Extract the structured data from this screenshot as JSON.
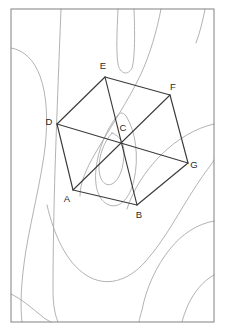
{
  "figure": {
    "frame": {
      "x": 11,
      "y": 9,
      "width": 203,
      "height": 313
    },
    "colors": {
      "background": "#ffffff",
      "frame_stroke": "#8c8c8c",
      "contour_stroke": "#a9a9a9",
      "polygon_stroke": "#3a3a3a",
      "label_text": "#2b2b2b"
    },
    "vertex_labels": [
      "A",
      "B",
      "C",
      "D",
      "E",
      "F",
      "G"
    ],
    "points": [
      {
        "name": "A",
        "label": "A",
        "x": 73,
        "y": 190,
        "label_x": 67,
        "label_y": 199
      },
      {
        "name": "B",
        "label": "B",
        "x": 137,
        "y": 205,
        "label_x": 139,
        "label_y": 215
      },
      {
        "name": "C",
        "label": "C",
        "x": 121,
        "y": 140,
        "label_x": 123,
        "label_y": 128
      },
      {
        "name": "D",
        "label": "D",
        "x": 57,
        "y": 124,
        "label_x": 49,
        "label_y": 122
      },
      {
        "name": "E",
        "label": "E",
        "x": 105,
        "y": 77,
        "label_x": 103,
        "label_y": 66
      },
      {
        "name": "F",
        "label": "F",
        "x": 170,
        "y": 95,
        "label_x": 173,
        "label_y": 87
      },
      {
        "name": "G",
        "label": "G",
        "x": 188,
        "y": 163,
        "label_x": 194,
        "label_y": 165
      }
    ],
    "edges": [
      {
        "name": "edge-A-D",
        "from": "A",
        "to": "D"
      },
      {
        "name": "edge-D-E",
        "from": "D",
        "to": "E"
      },
      {
        "name": "edge-E-F",
        "from": "E",
        "to": "F"
      },
      {
        "name": "edge-F-G",
        "from": "F",
        "to": "G"
      },
      {
        "name": "edge-G-B",
        "from": "G",
        "to": "B"
      },
      {
        "name": "edge-B-A",
        "from": "B",
        "to": "A"
      }
    ],
    "diagonals": [
      {
        "name": "diagonal-A-F",
        "from": "A",
        "to": "F"
      },
      {
        "name": "diagonal-B-E",
        "from": "B",
        "to": "E"
      },
      {
        "name": "diagonal-D-G",
        "from": "D",
        "to": "G"
      }
    ],
    "contours": [
      {
        "name": "contour-top-narrow-loop",
        "d": "M 118 9 C 117 32 116 52 118 64 C 120 74 128 76 132 68 C 135 58 135 32 134 9"
      },
      {
        "name": "contour-top-right-sweep",
        "d": "M 161 9 C 157 30 150 55 140 76 C 128 101 110 128 96 152 C 86 169 80 183 80 196"
      },
      {
        "name": "contour-left-vertical",
        "d": "M 61 9 C 60 34 59 60 58 86 C 57 112 56 140 55 170 C 54 205 53 250 53 290 C 53 305 55 315 58 322"
      },
      {
        "name": "contour-left-bulge",
        "d": "M 11 48 C 24 50 34 60 40 76 C 47 95 48 120 45 148 C 41 180 32 215 26 250 C 21 282 20 305 22 322"
      },
      {
        "name": "contour-center-small-loop",
        "d": "M 112 133 C 104 142 99 155 99 168 C 99 180 105 187 112 184 C 120 180 124 166 124 152 C 124 143 120 136 112 133 Z"
      },
      {
        "name": "contour-mid-oval",
        "d": "M 117 116 C 106 130 98 150 96 169 C 94 188 99 201 109 205 C 120 209 130 198 134 180 C 139 158 136 131 126 116 C 123 112 120 112 117 116 Z"
      },
      {
        "name": "contour-lower-left-basin",
        "d": "M 47 205 C 54 235 66 262 86 275 C 106 288 128 281 145 262 C 165 240 180 210 196 186 C 205 172 212 164 214 160"
      },
      {
        "name": "contour-right-upper-sweep",
        "d": "M 214 124 C 196 128 177 139 161 155 C 145 171 133 190 127 209"
      },
      {
        "name": "contour-right-lower-sweep",
        "d": "M 214 221 C 197 224 182 234 170 249 C 156 266 146 289 142 310 C 140 317 139 321 139 322"
      },
      {
        "name": "contour-bottom-left-diagonal",
        "d": "M 11 294 C 20 298 32 308 44 318 C 47 320 49 321 51 322"
      },
      {
        "name": "contour-bottom-right-arc",
        "d": "M 214 275 C 203 281 194 292 188 305 C 185 312 183 318 182 322"
      },
      {
        "name": "contour-upper-right-edge",
        "d": "M 205 9 C 203 20 200 32 196 43"
      }
    ]
  }
}
